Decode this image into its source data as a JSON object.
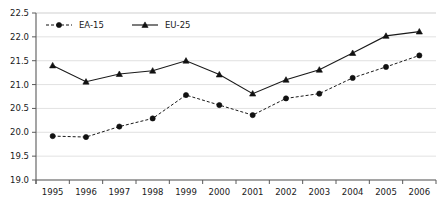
{
  "chart_data": {
    "type": "line",
    "title": "",
    "subtitle": "",
    "xlabel": "",
    "ylabel": "",
    "categories": [
      "1995",
      "1996",
      "1997",
      "1998",
      "1999",
      "2000",
      "2001",
      "2002",
      "2003",
      "2004",
      "2005",
      "2006"
    ],
    "series": [
      {
        "name": "EA-15",
        "marker": "circle",
        "linestyle": "dashed",
        "color": "#111111",
        "values": [
          19.92,
          19.9,
          20.12,
          20.29,
          20.78,
          20.57,
          20.36,
          20.71,
          20.81,
          21.14,
          21.37,
          21.61
        ]
      },
      {
        "name": "EU-25",
        "marker": "triangle",
        "linestyle": "solid",
        "color": "#111111",
        "values": [
          21.4,
          21.06,
          21.22,
          21.29,
          21.5,
          21.21,
          20.81,
          21.1,
          21.31,
          21.66,
          22.02,
          22.11
        ]
      }
    ],
    "ylim": [
      19.0,
      22.5
    ],
    "yticks": [
      "19.0",
      "19.5",
      "20.0",
      "20.5",
      "21.0",
      "21.5",
      "22.0",
      "22.5"
    ],
    "ytick_values": [
      19.0,
      19.5,
      20.0,
      20.5,
      21.0,
      21.5,
      22.0,
      22.5
    ],
    "grid": true,
    "grid_axis": "y",
    "legend_position": "top-left",
    "legend_entries": [
      "EA-15",
      "EU-25"
    ],
    "colors": {
      "line": "#111111",
      "grid": "#d9d9d9",
      "axis": "#5a5a5a",
      "text": "#1a1a1a",
      "background": "#ffffff"
    }
  },
  "layout": {
    "plot_left": 36,
    "plot_right": 436,
    "plot_top": 13,
    "plot_bottom": 180
  }
}
